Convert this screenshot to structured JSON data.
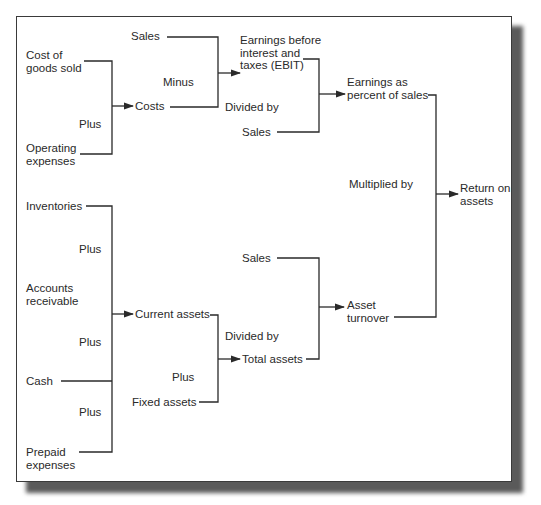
{
  "diagram": {
    "top_branch": {
      "cost_of_goods_sold": "Cost of\ngoods sold",
      "plus_1": "Plus",
      "operating_expenses": "Operating\nexpenses",
      "costs": "Costs",
      "sales_1": "Sales",
      "minus": "Minus",
      "ebit": "Earnings before\ninterest and\ntaxes (EBIT)",
      "divided_by_1": "Divided by",
      "sales_2": "Sales",
      "earnings_pct": "Earnings as\npercent of sales"
    },
    "multiplied_by": "Multiplied by",
    "return_on_assets": "Return on\nassets",
    "bottom_branch": {
      "inventories": "Inventories",
      "plus_2": "Plus",
      "accounts_receivable": "Accounts\nreceivable",
      "plus_3": "Plus",
      "cash": "Cash",
      "plus_4": "Plus",
      "prepaid_expenses": "Prepaid\nexpenses",
      "current_assets": "Current assets",
      "divided_by_2": "Divided by",
      "plus_5": "Plus",
      "fixed_assets": "Fixed assets",
      "total_assets": "Total assets",
      "sales_3": "Sales",
      "asset_turnover": "Asset\nturnover"
    },
    "colors": {
      "line": "#2a2a2a",
      "text": "#2a2a2a",
      "frame_border": "#3a3a3a",
      "shadow": "#5a5a5a"
    }
  }
}
